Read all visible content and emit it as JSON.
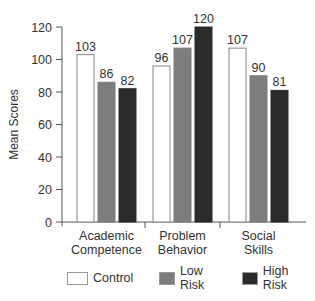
{
  "chart_data": {
    "type": "bar",
    "title": "",
    "xlabel": "",
    "ylabel": "Mean Scores",
    "ylim": [
      0,
      120
    ],
    "yticks": [
      0,
      20,
      40,
      60,
      80,
      100,
      120
    ],
    "grid": false,
    "legend_position": "bottom",
    "categories": [
      "Academic Competence",
      "Problem Behavior",
      "Social Skills"
    ],
    "category_lines": [
      [
        "Academic",
        "Competence"
      ],
      [
        "Problem",
        "Behavior"
      ],
      [
        "Social",
        "Skills"
      ]
    ],
    "series": [
      {
        "name": "Control",
        "values": [
          103,
          96,
          107
        ],
        "color": "#ffffff"
      },
      {
        "name": "Low Risk",
        "values": [
          86,
          107,
          90
        ],
        "color": "#7d7d7d"
      },
      {
        "name": "High Risk",
        "values": [
          82,
          120,
          81
        ],
        "color": "#2b2b2b"
      }
    ]
  },
  "legend": {
    "items": [
      {
        "label": "Control",
        "color": "#ffffff"
      },
      {
        "label": "Low Risk",
        "color": "#7d7d7d"
      },
      {
        "label": "High Risk",
        "color": "#2b2b2b"
      }
    ]
  }
}
